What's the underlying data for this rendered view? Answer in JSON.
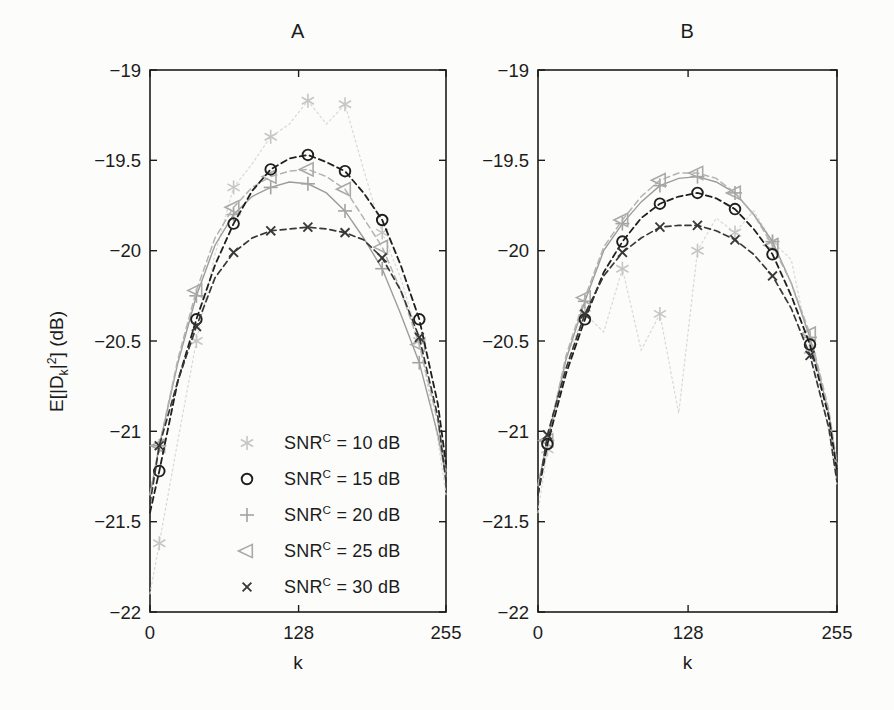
{
  "figure": {
    "ylabel": "E[|D_k|^2] (dB)",
    "background": "#fcfcfb",
    "ink": "#1c1c1c"
  },
  "legend": {
    "location": "inside-subplot-a-lower-center",
    "entries": [
      {
        "id": "snr-10db",
        "label": "SNR^C = 10 dB",
        "marker": "asterisk",
        "color": "#c6c6c6"
      },
      {
        "id": "snr-15db",
        "label": "SNR^C = 15 dB",
        "marker": "circle",
        "color": "#1f1f1f"
      },
      {
        "id": "snr-20db",
        "label": "SNR^C = 20 dB",
        "marker": "plus",
        "color": "#a3a3a3"
      },
      {
        "id": "snr-25db",
        "label": "SNR^C = 25 dB",
        "marker": "triangle-left",
        "color": "#a9a9a9"
      },
      {
        "id": "snr-30db",
        "label": "SNR^C = 30 dB",
        "marker": "x",
        "color": "#3a3a3a"
      }
    ]
  },
  "chart_data": [
    {
      "type": "line",
      "title": "A",
      "xlabel": "k",
      "ylabel": "E[|D_k|^2] (dB)",
      "xlim": [
        0,
        255
      ],
      "ylim": [
        -22,
        -19
      ],
      "xticks": [
        0,
        128,
        255
      ],
      "yticks": [
        -19,
        -19.5,
        -20,
        -20.5,
        -21,
        -21.5,
        -22
      ],
      "grid": false,
      "x": [
        0,
        8,
        24,
        40,
        56,
        72,
        88,
        104,
        120,
        136,
        152,
        168,
        184,
        200,
        216,
        232,
        248,
        255
      ],
      "marker_indices": [
        1,
        3,
        5,
        7,
        9,
        11,
        13,
        15
      ],
      "series": [
        {
          "id": "snr-10db",
          "name": "SNR^C = 10 dB",
          "marker": "asterisk",
          "line_style": "dotted",
          "line_color": "#d8d8d8",
          "marker_color": "#c6c6c6",
          "values": [
            -21.9,
            -21.62,
            -21.05,
            -20.5,
            -20.02,
            -19.65,
            -19.52,
            -19.37,
            -19.3,
            -19.17,
            -19.3,
            -19.19,
            -19.55,
            -19.9,
            -20.15,
            -20.5,
            -21.05,
            -21.35
          ]
        },
        {
          "id": "snr-15db",
          "name": "SNR^C = 15 dB",
          "marker": "circle",
          "line_style": "dashed",
          "line_color": "#1f1f1f",
          "marker_color": "#1f1f1f",
          "values": [
            -21.45,
            -21.22,
            -20.72,
            -20.38,
            -20.08,
            -19.85,
            -19.67,
            -19.55,
            -19.49,
            -19.47,
            -19.51,
            -19.56,
            -19.68,
            -19.83,
            -20.08,
            -20.38,
            -20.85,
            -21.18
          ]
        },
        {
          "id": "snr-20db",
          "name": "SNR^C = 20 dB",
          "marker": "plus",
          "line_style": "solid",
          "line_color": "#9c9c9c",
          "marker_color": "#a3a3a3",
          "values": [
            -21.35,
            -21.08,
            -20.62,
            -20.25,
            -19.97,
            -19.8,
            -19.7,
            -19.65,
            -19.62,
            -19.63,
            -19.68,
            -19.78,
            -19.93,
            -20.1,
            -20.35,
            -20.62,
            -21.02,
            -21.25
          ]
        },
        {
          "id": "snr-25db",
          "name": "SNR^C = 25 dB",
          "marker": "triangle-left",
          "line_style": "dashed",
          "line_color": "#b3b3b3",
          "marker_color": "#a9a9a9",
          "values": [
            -21.35,
            -21.08,
            -20.6,
            -20.22,
            -19.93,
            -19.76,
            -19.65,
            -19.59,
            -19.56,
            -19.55,
            -19.59,
            -19.66,
            -19.82,
            -19.98,
            -20.22,
            -20.52,
            -20.95,
            -21.22
          ]
        },
        {
          "id": "snr-30db",
          "name": "SNR^C = 30 dB",
          "marker": "x",
          "line_style": "dashed",
          "line_color": "#383838",
          "marker_color": "#383838",
          "values": [
            -21.4,
            -21.08,
            -20.72,
            -20.42,
            -20.15,
            -20.01,
            -19.93,
            -19.89,
            -19.88,
            -19.87,
            -19.88,
            -19.9,
            -19.94,
            -20.04,
            -20.22,
            -20.48,
            -20.92,
            -21.28
          ]
        }
      ]
    },
    {
      "type": "line",
      "title": "B",
      "xlabel": "k",
      "ylabel": "E[|D_k|^2] (dB)",
      "xlim": [
        0,
        255
      ],
      "ylim": [
        -22,
        -19
      ],
      "xticks": [
        0,
        128,
        255
      ],
      "yticks": [
        -19,
        -19.5,
        -20,
        -20.5,
        -21,
        -21.5,
        -22
      ],
      "grid": false,
      "x": [
        0,
        8,
        24,
        40,
        56,
        72,
        88,
        104,
        120,
        136,
        152,
        168,
        184,
        200,
        216,
        232,
        248,
        255
      ],
      "marker_indices": [
        1,
        3,
        5,
        7,
        9,
        11,
        13,
        15
      ],
      "series": [
        {
          "id": "snr-10db",
          "name": "SNR^C = 10 dB",
          "marker": "asterisk",
          "line_style": "dotted",
          "line_color": "#d8d8d8",
          "marker_color": "#c6c6c6",
          "values": [
            -21.45,
            -21.1,
            -20.6,
            -20.35,
            -20.45,
            -20.1,
            -20.55,
            -20.35,
            -20.9,
            -20.0,
            -19.82,
            -19.9,
            -19.78,
            -19.95,
            -20.05,
            -20.55,
            -21.0,
            -21.3
          ]
        },
        {
          "id": "snr-15db",
          "name": "SNR^C = 15 dB",
          "marker": "circle",
          "line_style": "dashed",
          "line_color": "#1f1f1f",
          "marker_color": "#1f1f1f",
          "values": [
            -21.35,
            -21.07,
            -20.68,
            -20.38,
            -20.12,
            -19.95,
            -19.82,
            -19.74,
            -19.7,
            -19.68,
            -19.71,
            -19.77,
            -19.88,
            -20.02,
            -20.25,
            -20.52,
            -20.92,
            -21.22
          ]
        },
        {
          "id": "snr-20db",
          "name": "SNR^C = 20 dB",
          "marker": "plus",
          "line_style": "solid",
          "line_color": "#9c9c9c",
          "marker_color": "#a3a3a3",
          "values": [
            -21.3,
            -21.05,
            -20.6,
            -20.28,
            -20.0,
            -19.85,
            -19.73,
            -19.64,
            -19.6,
            -19.59,
            -19.62,
            -19.68,
            -19.8,
            -19.95,
            -20.18,
            -20.48,
            -20.9,
            -21.2
          ]
        },
        {
          "id": "snr-25db",
          "name": "SNR^C = 25 dB",
          "marker": "triangle-left",
          "line_style": "dashed",
          "line_color": "#b3b3b3",
          "marker_color": "#a9a9a9",
          "values": [
            -21.3,
            -21.05,
            -20.58,
            -20.26,
            -19.98,
            -19.83,
            -19.7,
            -19.61,
            -19.57,
            -19.57,
            -19.6,
            -19.68,
            -19.8,
            -19.97,
            -20.18,
            -20.46,
            -20.88,
            -21.18
          ]
        },
        {
          "id": "snr-30db",
          "name": "SNR^C = 30 dB",
          "marker": "x",
          "line_style": "dashed",
          "line_color": "#383838",
          "marker_color": "#383838",
          "values": [
            -21.35,
            -21.02,
            -20.65,
            -20.35,
            -20.14,
            -20.01,
            -19.93,
            -19.87,
            -19.86,
            -19.86,
            -19.89,
            -19.94,
            -20.02,
            -20.14,
            -20.32,
            -20.58,
            -20.98,
            -21.28
          ]
        }
      ]
    }
  ]
}
